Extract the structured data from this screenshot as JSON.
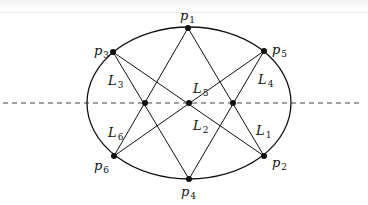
{
  "diagram": {
    "ellipse": {
      "cx": 189,
      "cy": 103,
      "rx": 102,
      "ry": 76
    },
    "axis_line": {
      "x1": 3,
      "x2": 362,
      "y": 103,
      "style": "dashed"
    },
    "points": [
      {
        "id": "p1",
        "label": "p",
        "sub": "1",
        "x": 188,
        "y": 28,
        "lx": 180,
        "ly": 20
      },
      {
        "id": "p2",
        "label": "p",
        "sub": "2",
        "x": 264,
        "y": 156,
        "lx": 272,
        "ly": 167
      },
      {
        "id": "p3",
        "label": "p",
        "sub": "3",
        "x": 113,
        "y": 52,
        "lx": 94,
        "ly": 55
      },
      {
        "id": "p4",
        "label": "p",
        "sub": "4",
        "x": 189,
        "y": 179,
        "lx": 181,
        "ly": 196
      },
      {
        "id": "p5",
        "label": "p",
        "sub": "5",
        "x": 264,
        "y": 51,
        "lx": 272,
        "ly": 54
      },
      {
        "id": "p6",
        "label": "p",
        "sub": "6",
        "x": 114,
        "y": 156,
        "lx": 94,
        "ly": 170
      }
    ],
    "chords": [
      {
        "id": "L1",
        "from": "p2",
        "to": "p1",
        "label": "L",
        "sub": "1",
        "lx": 256,
        "ly": 135
      },
      {
        "id": "L2",
        "from": "p3",
        "to": "p2",
        "label": "L",
        "sub": "2",
        "lx": 193,
        "ly": 130
      },
      {
        "id": "L3",
        "from": "p3",
        "to": "p4",
        "label": "L",
        "sub": "3",
        "lx": 108,
        "ly": 85
      },
      {
        "id": "L4",
        "from": "p5",
        "to": "p4",
        "label": "L",
        "sub": "4",
        "lx": 258,
        "ly": 84
      },
      {
        "id": "L5",
        "from": "p6",
        "to": "p5",
        "label": "L",
        "sub": "5",
        "lx": 193,
        "ly": 93
      },
      {
        "id": "L6",
        "from": "p6",
        "to": "p1",
        "label": "L",
        "sub": "6",
        "lx": 108,
        "ly": 137
      }
    ],
    "intersections": [
      {
        "x": 145,
        "y": 103
      },
      {
        "x": 189,
        "y": 103
      },
      {
        "x": 233,
        "y": 103
      }
    ],
    "colors": {
      "stroke": "#111111",
      "dash": "#444444",
      "background": "#ffffff"
    }
  }
}
